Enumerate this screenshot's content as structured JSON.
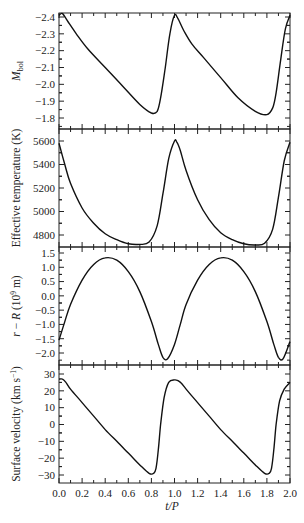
{
  "chart_data": [
    {
      "type": "line",
      "title": "",
      "xlabel": "t/P",
      "ylabel": "M_bol",
      "ylabel_main": "M",
      "ylabel_sub": "bol",
      "xlim": [
        0.0,
        2.0
      ],
      "ylim": [
        -1.75,
        -2.43
      ],
      "y_inverted": true,
      "yticks": [
        -2.4,
        -2.3,
        -2.2,
        -2.1,
        -2.0,
        -1.9,
        -1.8
      ],
      "ytick_labels": [
        "−2.4",
        "−2.3",
        "−2.2",
        "−2.1",
        "−2.0",
        "−1.9",
        "−1.8"
      ],
      "grid": false,
      "series": [
        {
          "name": "Bolometric magnitude",
          "x": [
            0.0,
            0.03,
            0.08,
            0.15,
            0.25,
            0.4,
            0.55,
            0.7,
            0.8,
            0.85,
            0.88,
            0.92,
            0.96,
            1.0,
            1.03,
            1.08,
            1.15,
            1.25,
            1.4,
            1.55,
            1.7,
            1.8,
            1.85,
            1.88,
            1.92,
            1.96,
            2.0
          ],
          "y": [
            -2.41,
            -2.42,
            -2.37,
            -2.3,
            -2.21,
            -2.1,
            -1.99,
            -1.88,
            -1.83,
            -1.84,
            -1.92,
            -2.1,
            -2.3,
            -2.41,
            -2.39,
            -2.32,
            -2.24,
            -2.16,
            -2.04,
            -1.92,
            -1.84,
            -1.82,
            -1.86,
            -1.95,
            -2.15,
            -2.33,
            -2.41
          ]
        }
      ]
    },
    {
      "type": "line",
      "xlabel": "t/P",
      "ylabel": "Effective temperature (K)",
      "xlim": [
        0.0,
        2.0
      ],
      "ylim": [
        4700,
        5640
      ],
      "yticks": [
        4800,
        5000,
        5200,
        5400,
        5600
      ],
      "ytick_labels": [
        "4800",
        "5000",
        "5200",
        "5400",
        "5600"
      ],
      "grid": false,
      "series": [
        {
          "name": "Effective temperature",
          "x": [
            0.0,
            0.05,
            0.1,
            0.2,
            0.3,
            0.4,
            0.5,
            0.6,
            0.7,
            0.78,
            0.85,
            0.9,
            0.95,
            1.0,
            1.02,
            1.05,
            1.1,
            1.2,
            1.3,
            1.4,
            1.5,
            1.6,
            1.7,
            1.78,
            1.85,
            1.9,
            1.95,
            2.0
          ],
          "y": [
            5580,
            5400,
            5240,
            5030,
            4900,
            4810,
            4760,
            4725,
            4720,
            4740,
            4880,
            5150,
            5450,
            5600,
            5590,
            5520,
            5350,
            5100,
            4930,
            4820,
            4760,
            4725,
            4715,
            4730,
            4850,
            5120,
            5430,
            5590
          ]
        }
      ]
    },
    {
      "type": "line",
      "xlabel": "t/P",
      "ylabel": "r − R (10^9 m)",
      "ylabel_main": "r − R (10",
      "ylabel_sup": "9",
      "ylabel_end": " m)",
      "xlim": [
        0.0,
        2.0
      ],
      "ylim": [
        -2.3,
        1.7
      ],
      "yticks": [
        -2.0,
        -1.5,
        -1.0,
        -0.5,
        0.0,
        0.5,
        1.0,
        1.5
      ],
      "ytick_labels": [
        "−2.0",
        "−1.5",
        "−1.0",
        "−0.5",
        "0.0",
        "0.5",
        "1.0",
        "1.5"
      ],
      "grid": false,
      "series": [
        {
          "name": "Radius deviation",
          "x": [
            0.0,
            0.05,
            0.1,
            0.2,
            0.3,
            0.4,
            0.5,
            0.6,
            0.7,
            0.8,
            0.86,
            0.9,
            0.94,
            1.0,
            1.05,
            1.1,
            1.2,
            1.3,
            1.4,
            1.5,
            1.6,
            1.7,
            1.8,
            1.86,
            1.9,
            1.94,
            2.0
          ],
          "y": [
            -1.55,
            -0.9,
            -0.3,
            0.55,
            1.1,
            1.33,
            1.25,
            0.85,
            0.15,
            -0.9,
            -1.7,
            -2.15,
            -2.2,
            -1.7,
            -1.0,
            -0.3,
            0.55,
            1.1,
            1.33,
            1.25,
            0.85,
            0.15,
            -0.9,
            -1.7,
            -2.15,
            -2.2,
            -1.6
          ]
        }
      ]
    },
    {
      "type": "line",
      "xlabel": "t/P",
      "ylabel": "Surface velocity (km s^-1)",
      "ylabel_main": "Surface velocity (km s",
      "ylabel_sup": "−1",
      "ylabel_end": ")",
      "xlim": [
        0.0,
        2.0
      ],
      "ylim": [
        -35,
        34
      ],
      "yticks": [
        -30,
        -20,
        -10,
        0,
        10,
        20,
        30
      ],
      "ytick_labels": [
        "−30",
        "−20",
        "−10",
        "0",
        "10",
        "20",
        "30"
      ],
      "xticks": [
        0.0,
        0.2,
        0.4,
        0.6,
        0.8,
        1.0,
        1.2,
        1.4,
        1.6,
        1.8,
        2.0
      ],
      "xtick_labels": [
        "0.0",
        "0.2",
        "0.4",
        "0.6",
        "0.8",
        "1.0",
        "1.2",
        "1.4",
        "1.6",
        "1.8",
        "2.0"
      ],
      "grid": false,
      "series": [
        {
          "name": "Surface velocity",
          "x": [
            0.0,
            0.03,
            0.06,
            0.1,
            0.2,
            0.3,
            0.4,
            0.5,
            0.6,
            0.7,
            0.78,
            0.82,
            0.84,
            0.86,
            0.88,
            0.91,
            0.95,
            1.0,
            1.03,
            1.06,
            1.1,
            1.2,
            1.3,
            1.4,
            1.5,
            1.6,
            1.7,
            1.78,
            1.82,
            1.84,
            1.86,
            1.88,
            1.91,
            1.95,
            2.0
          ],
          "y": [
            27,
            27,
            25,
            21,
            13,
            5,
            -3,
            -10,
            -17,
            -24,
            -29,
            -29,
            -26,
            -15,
            0,
            16,
            25,
            26.5,
            26,
            24.5,
            21,
            13,
            5,
            -3,
            -10,
            -17,
            -24,
            -29,
            -29,
            -26,
            -15,
            0,
            14,
            21,
            25
          ]
        }
      ]
    }
  ],
  "axes": {
    "xlabel": "t/P",
    "xlabel_italic_t": "t",
    "xlabel_slash": "/",
    "xlabel_italic_p": "P"
  }
}
